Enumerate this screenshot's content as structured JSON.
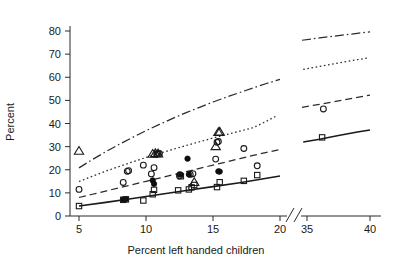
{
  "chart_data": {
    "type": "scatter",
    "title": "",
    "subtitle": "",
    "xlabel": "Percent left handed children",
    "ylabel": "Percent",
    "xlim": [
      4,
      20.6
    ],
    "xlim_right": [
      34,
      40.8
    ],
    "ylim": [
      0,
      85
    ],
    "grid": false,
    "legend": "none",
    "axis_break": {
      "present": true,
      "between": [
        20.6,
        34.0
      ],
      "style": "double-slash"
    },
    "xticks": [
      5,
      10,
      15,
      20,
      35,
      40
    ],
    "xtick_labels": [
      "5",
      "10",
      "15",
      "20",
      "35",
      "40"
    ],
    "yticks": [
      0,
      10,
      20,
      30,
      40,
      50,
      60,
      70,
      80
    ],
    "ytick_labels": [
      "0",
      "10",
      "20",
      "30",
      "40",
      "50",
      "60",
      "70",
      "80"
    ],
    "series": [
      {
        "name": "curve-dash-dot",
        "marker": "none",
        "linestyle": "dashdot",
        "color": "#2b2b2b",
        "x": [
          5.0,
          6.0,
          7.0,
          8.0,
          9.0,
          10.0,
          11.0,
          12.0,
          13.0,
          14.0,
          15.0,
          16.0,
          17.0,
          18.0,
          19.0,
          20.0
        ],
        "y": [
          20.8,
          24.4,
          27.8,
          31.0,
          34.0,
          36.9,
          39.6,
          42.2,
          44.7,
          47.0,
          49.3,
          51.4,
          53.4,
          55.4,
          57.3,
          59.1
        ],
        "x_right": [
          34.6,
          36.0,
          37.5,
          39.0,
          40.0
        ],
        "y_right": [
          76.0,
          77.0,
          78.0,
          79.0,
          79.6
        ]
      },
      {
        "name": "curve-dotted",
        "marker": "none",
        "linestyle": "dotted",
        "color": "#2b2b2b",
        "x": [
          5.0,
          6.0,
          7.0,
          8.0,
          9.0,
          10.0,
          11.0,
          12.0,
          13.0,
          14.0,
          15.0,
          16.0,
          17.0,
          18.0,
          19.0,
          19.8
        ],
        "y": [
          14.9,
          17.2,
          19.4,
          21.4,
          23.4,
          25.3,
          27.1,
          28.8,
          30.5,
          32.1,
          33.7,
          35.2,
          36.7,
          38.2,
          41.0,
          43.5
        ],
        "x_right": [
          34.7,
          36.0,
          37.5,
          39.0,
          39.8
        ],
        "y_right": [
          63.4,
          64.7,
          66.2,
          67.6,
          68.3
        ]
      },
      {
        "name": "curve-dashed",
        "marker": "none",
        "linestyle": "dashed",
        "color": "#2b2b2b",
        "x": [
          5.0,
          6.0,
          7.0,
          8.0,
          9.0,
          10.0,
          11.0,
          12.0,
          13.0,
          14.0,
          15.0,
          16.0,
          17.0,
          18.0,
          19.0,
          20.0
        ],
        "y": [
          8.0,
          9.4,
          10.8,
          12.2,
          13.6,
          15.0,
          16.4,
          17.8,
          19.2,
          20.6,
          22.0,
          23.4,
          24.8,
          26.2,
          27.5,
          28.7
        ],
        "x_right": [
          34.6,
          36.0,
          37.5,
          39.0,
          40.0
        ],
        "y_right": [
          47.0,
          48.3,
          49.8,
          51.3,
          52.3
        ]
      },
      {
        "name": "curve-solid",
        "marker": "none",
        "linestyle": "solid",
        "color": "#1a1a1a",
        "x": [
          5.0,
          7.0,
          9.0,
          11.0,
          13.0,
          15.0,
          17.0,
          19.0,
          20.0
        ],
        "y": [
          4.3,
          5.9,
          7.6,
          9.3,
          11.0,
          12.7,
          14.4,
          16.3,
          17.3
        ],
        "x_right": [
          34.7,
          36.0,
          37.5,
          39.0,
          40.0
        ],
        "y_right": [
          32.0,
          33.2,
          34.8,
          36.3,
          37.2
        ]
      },
      {
        "name": "open-triangle-points",
        "marker": "triangle-open",
        "linestyle": "none",
        "color": "#1a1a1a",
        "x": [
          5.0,
          10.5,
          10.7,
          10.9,
          13.6,
          15.2,
          15.4,
          15.5
        ],
        "y": [
          28.2,
          26.9,
          27.2,
          27.1,
          14.7,
          30.2,
          36.3,
          36.5
        ]
      },
      {
        "name": "open-circle-points",
        "marker": "circle-open",
        "linestyle": "none",
        "color": "#1a1a1a",
        "x": [
          5.0,
          8.3,
          8.6,
          8.7,
          9.8,
          10.4,
          10.6,
          10.8,
          10.9,
          11.0,
          12.5,
          13.3,
          13.5,
          15.2,
          15.3,
          15.4,
          17.3,
          18.3,
          36.3
        ],
        "y": [
          11.5,
          14.5,
          19.3,
          19.6,
          22.0,
          18.2,
          20.9,
          26.8,
          27.1,
          27.0,
          17.3,
          18.0,
          18.3,
          24.6,
          31.9,
          32.2,
          29.2,
          21.7,
          46.3
        ]
      },
      {
        "name": "filled-circle-points",
        "marker": "circle-filled",
        "linestyle": "none",
        "color": "#0d0d0d",
        "x": [
          8.3,
          8.5,
          10.5,
          10.6,
          12.5,
          12.6,
          13.1,
          13.2,
          15.4,
          15.5
        ],
        "y": [
          7.1,
          7.3,
          15.4,
          13.9,
          18.0,
          17.9,
          24.8,
          18.0,
          19.3,
          19.2
        ]
      },
      {
        "name": "open-square-points",
        "marker": "square-open",
        "linestyle": "none",
        "color": "#1a1a1a",
        "x": [
          5.0,
          8.3,
          8.5,
          9.8,
          10.5,
          10.6,
          12.4,
          12.6,
          13.2,
          13.4,
          13.6,
          15.3,
          15.5,
          17.3,
          18.3,
          36.2
        ],
        "y": [
          4.3,
          7.0,
          7.2,
          6.7,
          9.4,
          11.3,
          11.1,
          17.2,
          11.5,
          12.4,
          13.4,
          12.5,
          14.6,
          15.2,
          17.7,
          34.0
        ]
      }
    ]
  },
  "axis": {
    "y_label": "Percent",
    "x_label": "Percent left handed children"
  }
}
